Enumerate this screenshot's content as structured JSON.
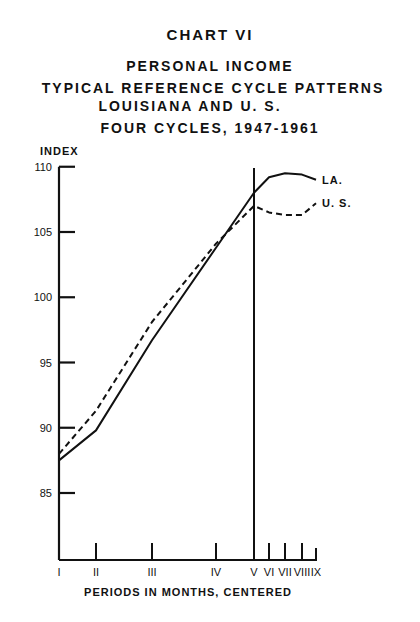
{
  "header": {
    "chart_label": "CHART VI",
    "title_line1": "PERSONAL INCOME",
    "title_line2": "TYPICAL REFERENCE CYCLE PATTERNS",
    "title_line3": "LOUISIANA AND U. S.",
    "subtitle": "FOUR CYCLES, 1947-1961"
  },
  "chart_data": {
    "type": "line",
    "xlabel": "PERIODS IN MONTHS, CENTERED",
    "ylabel": "INDEX",
    "categories": [
      "I",
      "II",
      "III",
      "IV",
      "V",
      "VI",
      "VII",
      "VIII",
      "IX"
    ],
    "yticks": [
      85,
      90,
      95,
      100,
      105,
      110
    ],
    "ylim": [
      80,
      110
    ],
    "grid": false,
    "reference_line": "V",
    "series": [
      {
        "name": "LA.",
        "style": "solid",
        "values": [
          87.5,
          89.8,
          96.7,
          103.8,
          108.0,
          109.2,
          109.5,
          109.4,
          109.0
        ]
      },
      {
        "name": "U. S.",
        "style": "dashed",
        "values": [
          88.0,
          91.3,
          98.1,
          104.1,
          107.0,
          106.5,
          106.3,
          106.3,
          107.2
        ]
      }
    ],
    "legend": "inline labels at line ends"
  }
}
